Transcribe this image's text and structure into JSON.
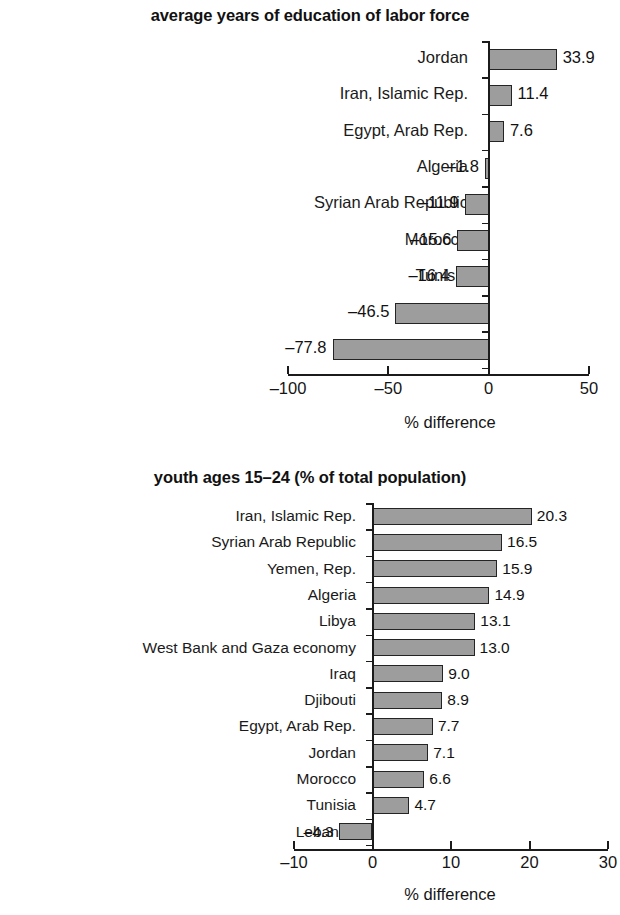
{
  "chart_data": [
    {
      "type": "bar",
      "orientation": "horizontal",
      "title": "average years of education of labor force",
      "xlabel": "% difference",
      "ylabel": "",
      "xlim": [
        -100,
        50
      ],
      "xticks": [
        -100,
        -50,
        0,
        50
      ],
      "xticklabels": [
        "–100",
        "–50",
        "0",
        "50"
      ],
      "grid": false,
      "legend": null,
      "bar_color": "#9d9d9d",
      "bar_edge_color": "#242424",
      "categories": [
        "Jordan",
        "Iran, Islamic Rep.",
        "Egypt, Arab Rep.",
        "Algeria",
        "Syrian Arab Republic",
        "Morocco",
        "Tunisia",
        "Iraq",
        "Yemen, Rep."
      ],
      "values": [
        33.9,
        11.4,
        7.6,
        -1.8,
        -11.9,
        -15.6,
        -16.4,
        -46.5,
        -77.8
      ],
      "value_labels": [
        "33.9",
        "11.4",
        "7.6",
        "–1.8",
        "–11.9",
        "–15.6",
        "–16.4",
        "–46.5",
        "–77.8"
      ]
    },
    {
      "type": "bar",
      "orientation": "horizontal",
      "title": "youth ages 15–24 (% of total population)",
      "xlabel": "% difference",
      "ylabel": "",
      "xlim": [
        -10,
        30
      ],
      "xticks": [
        -10,
        0,
        10,
        20,
        30
      ],
      "xticklabels": [
        "–10",
        "0",
        "10",
        "20",
        "30"
      ],
      "grid": false,
      "legend": null,
      "bar_color": "#9d9d9d",
      "bar_edge_color": "#242424",
      "categories": [
        "Iran, Islamic Rep.",
        "Syrian Arab Republic",
        "Yemen, Rep.",
        "Algeria",
        "Libya",
        "West Bank and Gaza economy",
        "Iraq",
        "Djibouti",
        "Egypt, Arab Rep.",
        "Jordan",
        "Morocco",
        "Tunisia",
        "Lebanon"
      ],
      "values": [
        20.3,
        16.5,
        15.9,
        14.9,
        13.1,
        13.0,
        9.0,
        8.9,
        7.7,
        7.1,
        6.6,
        4.7,
        -4.3
      ],
      "value_labels": [
        "20.3",
        "16.5",
        "15.9",
        "14.9",
        "13.1",
        "13.0",
        "9.0",
        "8.9",
        "7.7",
        "7.1",
        "6.6",
        "4.7",
        "–4.3"
      ]
    }
  ]
}
